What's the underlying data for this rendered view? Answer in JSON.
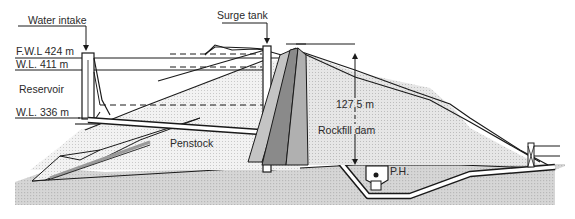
{
  "diagram": {
    "labels": {
      "water_intake": "Water intake",
      "surge_tank": "Surge tank",
      "fwl": "F.W.L 424 m",
      "wl_high": "W.L. 411 m",
      "reservoir": "Reservoir",
      "wl_low": "W.L. 336 m",
      "penstock": "Penstock",
      "dam_height": "127.5 m",
      "rockfill_dam": "Rockfill dam",
      "power_house": "P.H."
    },
    "elevations_m": {
      "full_water_level": 424,
      "high_water_level": 411,
      "low_water_level": 336
    },
    "dam_height_m": 127.5,
    "colors": {
      "line": "#1a1a1a",
      "ground_fill": "#cfcfcf",
      "fill_light": "#ececec",
      "core_dark": "#8a8a8a",
      "core_mid": "#b5b5b5",
      "background": "#ffffff"
    }
  }
}
